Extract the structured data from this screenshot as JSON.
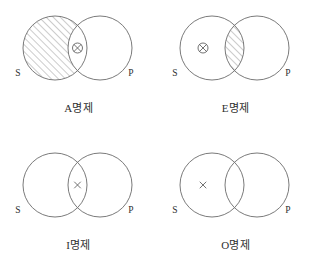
{
  "figure": {
    "background_color": "#ffffff",
    "stroke_color": "#6b6b6b",
    "text_color": "#2f2f2f",
    "mark_color": "#5a5a5a",
    "hatch_color": "#777777",
    "columns": 2,
    "rows": 2
  },
  "geometry": {
    "cell_width": 157,
    "cell_height": 137,
    "left_circle_cx": 55,
    "right_circle_cx": 100,
    "circle_cy": 48,
    "circle_r": 32,
    "label_s_x": 18,
    "label_p_x": 131,
    "label_y": 76,
    "caption_top": 99
  },
  "labels": {
    "subject": "S",
    "predicate": "P"
  },
  "marks": {
    "circled_x": "⊗",
    "plain_x": "×"
  },
  "diagrams": [
    {
      "id": "a-proposition",
      "caption": "A명제",
      "letter": "A",
      "shaded_region": "subject-only",
      "mark": "circled-x",
      "mark_region": "intersection",
      "subject_label": "S",
      "predicate_label": "P"
    },
    {
      "id": "e-proposition",
      "caption": "E명제",
      "letter": "E",
      "shaded_region": "intersection",
      "mark": "circled-x",
      "mark_region": "subject-only",
      "subject_label": "S",
      "predicate_label": "P"
    },
    {
      "id": "i-proposition",
      "caption": "I명제",
      "letter": "I",
      "shaded_region": "none",
      "mark": "plain-x",
      "mark_region": "intersection",
      "subject_label": "S",
      "predicate_label": "P"
    },
    {
      "id": "o-proposition",
      "caption": "O명제",
      "letter": "O",
      "shaded_region": "none",
      "mark": "plain-x",
      "mark_region": "subject-only",
      "subject_label": "S",
      "predicate_label": "P"
    }
  ]
}
